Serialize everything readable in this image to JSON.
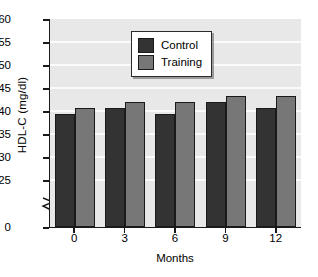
{
  "chart_data": {
    "type": "bar",
    "title": "",
    "xlabel": "Months",
    "ylabel": "HDL-C (mg/dl)",
    "categories": [
      "0",
      "3",
      "6",
      "9",
      "12"
    ],
    "series": [
      {
        "name": "Control",
        "color": "#333333",
        "values": [
          44,
          45,
          44,
          46,
          45
        ]
      },
      {
        "name": "Training",
        "color": "#777777",
        "values": [
          45,
          46,
          46,
          47,
          47
        ]
      }
    ],
    "ylim": [
      25,
      60
    ],
    "yticks": [
      "60",
      "55",
      "50",
      "45",
      "40",
      "35",
      "30",
      "25",
      "0"
    ],
    "axis_break": true,
    "axis_break_between": [
      "0",
      "25"
    ],
    "grid": true,
    "grid_orientation": "horizontal",
    "legend_position": "top-center",
    "plot_background": "#e8e8e8",
    "gridline_color": "#fbfbfb",
    "axis_color": "#1a1a1a"
  },
  "legend": {
    "entries": [
      {
        "label": "Control"
      },
      {
        "label": "Training"
      }
    ]
  }
}
